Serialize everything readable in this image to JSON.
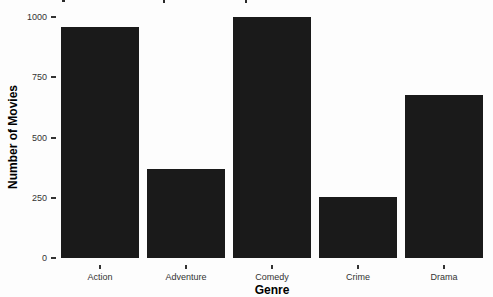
{
  "chart_data": {
    "type": "bar",
    "title": "",
    "xlabel": "Genre",
    "ylabel": "Number of Movies",
    "categories": [
      "Action",
      "Adventure",
      "Comedy",
      "Crime",
      "Drama"
    ],
    "values": [
      960,
      370,
      1000,
      255,
      675
    ],
    "ylim": [
      0,
      1000
    ],
    "yticks": [
      0,
      250,
      500,
      750,
      1000
    ],
    "grid": false,
    "legend": "none",
    "bar_color": "#1a1a1a",
    "axis_text_color": "#333333",
    "axis_title_color": "#000000",
    "background_color": "#fdfdfd"
  }
}
